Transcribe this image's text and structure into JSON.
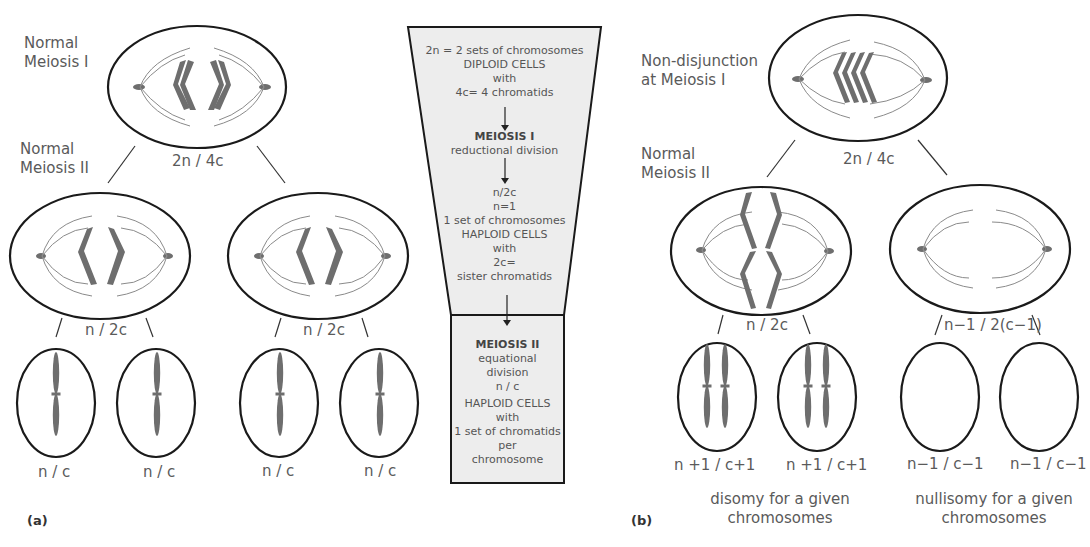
{
  "panel_a": {
    "tag": "(a)",
    "label_meiosis1": [
      "Normal",
      "Meiosis I"
    ],
    "label_meiosis2": [
      "Normal",
      "Meiosis II"
    ],
    "parent_cell_label": "2n / 4c",
    "daughter_labels": [
      "n / 2c",
      "n / 2c"
    ],
    "gamete_labels": [
      "n / c",
      "n / c",
      "n / c",
      "n / c"
    ]
  },
  "panel_b": {
    "tag": "(b)",
    "label_meiosis1": [
      "Non-disjunction",
      "at Meiosis I"
    ],
    "label_meiosis2": [
      "Normal",
      "Meiosis II"
    ],
    "parent_cell_label": "2n / 4c",
    "daughter_labels": [
      "n / 2c",
      "n−1 / 2(c−1)"
    ],
    "gamete_labels": [
      "n +1 / c+1",
      "n +1 / c+1",
      "n−1 / c−1",
      "n−1 / c−1"
    ],
    "outcome_left": [
      "disomy for a given",
      "chromosomes"
    ],
    "outcome_right": [
      "nullisomy for a given",
      "chromosomes"
    ]
  },
  "flowchart": {
    "stage1": [
      "2n = 2 sets of chromosomes",
      "DIPLOID CELLS",
      "with",
      "4c= 4 chromatids"
    ],
    "meiosis1_title": "MEIOSIS I",
    "meiosis1_sub": "reductional division",
    "stage2": [
      "n/2c",
      "n=1",
      "1 set of chromosomes",
      "HAPLOID CELLS",
      "with",
      "2c=",
      "sister chromatids"
    ],
    "meiosis2_title": "MEIOSIS II",
    "meiosis2_sub": [
      "equational",
      "division",
      "n / c"
    ],
    "stage3": [
      "HAPLOID CELLS",
      "with",
      "1 set of chromatids",
      "per",
      "chromosome"
    ]
  },
  "colors": {
    "outline": "#1a1a1a",
    "chromosome": "#6e6e6e",
    "spindle": "#8a8a8a",
    "flow_fill": "#ededed",
    "text": "#5a5a5a"
  }
}
